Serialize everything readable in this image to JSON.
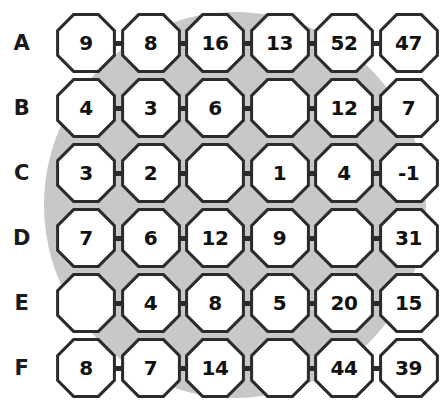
{
  "figure": {
    "type": "octagon-number-grid-puzzle",
    "row_labels": [
      "A",
      "B",
      "C",
      "D",
      "E",
      "F"
    ],
    "background_shape": "gray-circle",
    "colors": {
      "page_background": "#ffffff",
      "disc_fill": "#c8c8c8",
      "octagon_fill": "#ffffff",
      "octagon_stroke": "#2b2b2b",
      "connector": "#2b2b2b",
      "text": "#111111"
    },
    "blank_marker": "",
    "partial_caption": ""
  },
  "grid": {
    "columns": 6,
    "rows": [
      {
        "label": "A",
        "values": [
          "9",
          "8",
          "16",
          "13",
          "52",
          "47"
        ]
      },
      {
        "label": "B",
        "values": [
          "4",
          "3",
          "6",
          "",
          "12",
          "7"
        ]
      },
      {
        "label": "C",
        "values": [
          "3",
          "2",
          "",
          "1",
          "4",
          "-1"
        ]
      },
      {
        "label": "D",
        "values": [
          "7",
          "6",
          "12",
          "9",
          "",
          "31"
        ]
      },
      {
        "label": "E",
        "values": [
          "",
          "4",
          "8",
          "5",
          "20",
          "15"
        ]
      },
      {
        "label": "F",
        "values": [
          "8",
          "7",
          "14",
          "",
          "44",
          "39"
        ]
      }
    ]
  },
  "chart_data": {
    "type": "table",
    "title": "",
    "row_headers": [
      "A",
      "B",
      "C",
      "D",
      "E",
      "F"
    ],
    "column_headers": [
      "1",
      "2",
      "3",
      "4",
      "5",
      "6"
    ],
    "cells": [
      [
        "9",
        "8",
        "16",
        "13",
        "52",
        "47"
      ],
      [
        "4",
        "3",
        "6",
        "",
        "12",
        "7"
      ],
      [
        "3",
        "2",
        "",
        "1",
        "4",
        "-1"
      ],
      [
        "7",
        "6",
        "12",
        "9",
        "",
        "31"
      ],
      [
        "",
        "4",
        "8",
        "5",
        "20",
        "15"
      ],
      [
        "8",
        "7",
        "14",
        "",
        "44",
        "39"
      ]
    ],
    "blanks": [
      {
        "row": "B",
        "col": 4
      },
      {
        "row": "C",
        "col": 3
      },
      {
        "row": "D",
        "col": 5
      },
      {
        "row": "E",
        "col": 1
      },
      {
        "row": "F",
        "col": 4
      }
    ]
  }
}
